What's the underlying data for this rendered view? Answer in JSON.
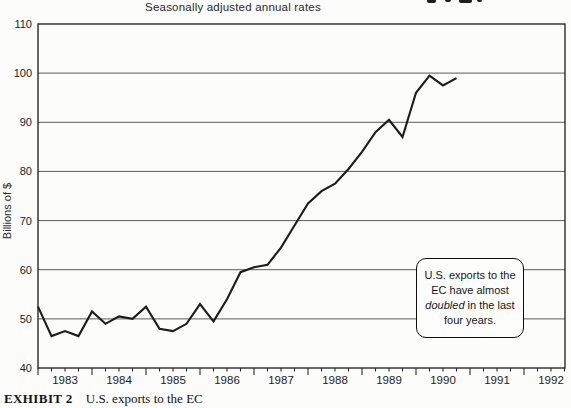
{
  "header": {
    "subtitle": "Seasonally adjusted annual rates"
  },
  "y_axis_label": "Billions of $",
  "annotation": {
    "lines": [
      "U.S. exports to the",
      "EC have almost",
      "doubled in the last",
      "four years."
    ],
    "italic_word": "doubled"
  },
  "caption": {
    "exhibit_label": "EXHIBIT 2",
    "text": "U.S. exports to the EC"
  },
  "chart_data": {
    "type": "line",
    "subtitle": "Seasonally adjusted annual rates",
    "ylabel": "Billions of $",
    "ylim": [
      40,
      110
    ],
    "y_ticks": [
      40,
      50,
      60,
      70,
      80,
      90,
      100,
      110
    ],
    "y_gridlines": [
      50,
      60,
      70,
      80,
      90,
      100
    ],
    "x_tick_years": [
      1983,
      1984,
      1985,
      1986,
      1987,
      1988,
      1989,
      1990,
      1991,
      1992
    ],
    "x_minor_ticks_per_year": 4,
    "grid": "horizontal",
    "legend": "none",
    "line_color": "#1c1c1c",
    "series": [
      {
        "name": "U.S. exports to the EC",
        "frequency": "quarterly",
        "start": "1983Q1",
        "end": "1990Q4",
        "values": [
          52.5,
          46.5,
          47.5,
          46.5,
          51.5,
          49,
          50.5,
          50,
          52.5,
          48,
          47.5,
          49,
          53,
          49.5,
          54,
          59.5,
          60.5,
          61,
          64.5,
          69,
          73.5,
          76,
          77.5,
          80.5,
          84,
          88,
          90.5,
          87,
          96,
          99.5,
          97.5,
          99
        ]
      }
    ]
  }
}
